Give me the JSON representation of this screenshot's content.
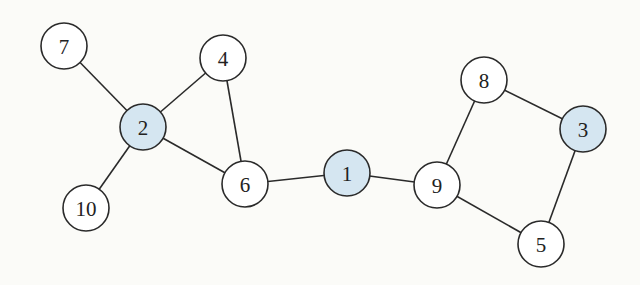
{
  "graph": {
    "node_radius": 23,
    "colors": {
      "highlight": "#d5e6f1",
      "default": "#ffffff",
      "stroke": "#2a2a2a"
    },
    "nodes": [
      {
        "id": "1",
        "label": "1",
        "x": 347,
        "y": 173,
        "highlighted": true
      },
      {
        "id": "2",
        "label": "2",
        "x": 143,
        "y": 127,
        "highlighted": true
      },
      {
        "id": "3",
        "label": "3",
        "x": 583,
        "y": 129,
        "highlighted": true
      },
      {
        "id": "4",
        "label": "4",
        "x": 223,
        "y": 58,
        "highlighted": false
      },
      {
        "id": "5",
        "label": "5",
        "x": 541,
        "y": 244,
        "highlighted": false
      },
      {
        "id": "6",
        "label": "6",
        "x": 245,
        "y": 184,
        "highlighted": false
      },
      {
        "id": "7",
        "label": "7",
        "x": 64,
        "y": 46,
        "highlighted": false
      },
      {
        "id": "8",
        "label": "8",
        "x": 484,
        "y": 80,
        "highlighted": false
      },
      {
        "id": "9",
        "label": "9",
        "x": 437,
        "y": 185,
        "highlighted": false
      },
      {
        "id": "10",
        "label": "10",
        "x": 86,
        "y": 208,
        "highlighted": false
      }
    ],
    "edges": [
      [
        "7",
        "2"
      ],
      [
        "2",
        "4"
      ],
      [
        "2",
        "6"
      ],
      [
        "2",
        "10"
      ],
      [
        "4",
        "6"
      ],
      [
        "6",
        "1"
      ],
      [
        "1",
        "9"
      ],
      [
        "9",
        "8"
      ],
      [
        "8",
        "3"
      ],
      [
        "9",
        "5"
      ],
      [
        "5",
        "3"
      ]
    ]
  }
}
